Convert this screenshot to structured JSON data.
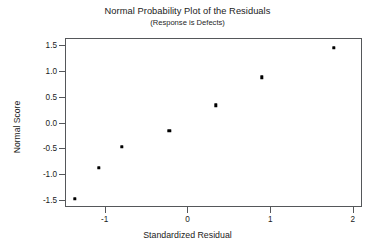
{
  "chart_data": {
    "type": "scatter",
    "title": "Normal Probability Plot of the Residuals",
    "subtitle": "(Response is Defects)",
    "xlabel": "Standardized Residual",
    "ylabel": "Normal Score",
    "xlim": [
      -1.48,
      2.11
    ],
    "ylim": [
      -1.63,
      1.63
    ],
    "xticks": [
      -1,
      0,
      1,
      2
    ],
    "xtick_labels": [
      "-1",
      "0",
      "1",
      "2"
    ],
    "yticks": [
      -1.5,
      -1.0,
      -0.5,
      0.0,
      0.5,
      1.0,
      1.5
    ],
    "ytick_labels": [
      "-1.5",
      "-1.0",
      "-0.5",
      "0.0",
      "0.5",
      "1.0",
      "1.5"
    ],
    "grid": false,
    "legend": false,
    "marker": "square",
    "marker_color": "#000000",
    "frame_color": "#55575a",
    "points": [
      {
        "x": -1.36,
        "y": -1.47
      },
      {
        "x": -1.07,
        "y": -0.87
      },
      {
        "x": -0.79,
        "y": -0.47
      },
      {
        "x": -0.22,
        "y": -0.16
      },
      {
        "x": 0.34,
        "y": 0.33
      },
      {
        "x": 0.9,
        "y": 0.87
      },
      {
        "x": 1.77,
        "y": 1.44
      }
    ]
  },
  "figure": {
    "background": "#ffffff"
  }
}
